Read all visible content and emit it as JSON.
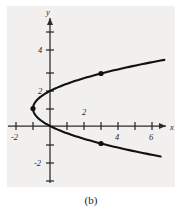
{
  "figure": {
    "caption": "(b)",
    "background_color": "#f1f0ee",
    "curve_color": "#111111",
    "axis_color": "#2b2b2b"
  },
  "axes": {
    "x_axis_name": "x",
    "y_axis_name": "y",
    "x_tick_labels": [
      "-2",
      "2",
      "4",
      "6"
    ],
    "y_tick_labels": [
      "4",
      "2",
      "-2"
    ],
    "x_ticks_all": [
      -2,
      -1,
      1,
      2,
      3,
      4,
      5,
      6,
      7
    ],
    "y_ticks_all": [
      5,
      4,
      3,
      2,
      1,
      -1,
      -2,
      -3
    ],
    "xlim": [
      -2.9,
      7.6
    ],
    "ylim": [
      -3.6,
      5.4
    ],
    "unit_px_x": 17,
    "unit_px_y": 17.5
  },
  "chart_data": {
    "type": "line",
    "title": "",
    "subtitle": "",
    "xlabel": "x",
    "ylabel": "y",
    "xlim": [
      -2.9,
      7.6
    ],
    "ylim": [
      -3.6,
      5.4
    ],
    "grid": false,
    "legend": "none",
    "equation": "x = (y - 1)^2 - 1",
    "orientation": "rightward-opening parabola",
    "vertex": [
      -1,
      1
    ],
    "series": [
      {
        "name": "parabola",
        "x": [
          -1.0,
          -0.96,
          -0.84,
          -0.64,
          -0.36,
          0.0,
          0.44,
          0.96,
          1.56,
          2.24,
          3.0,
          3.84,
          4.76,
          5.76,
          6.6
        ],
        "y": [
          1.0,
          1.2,
          1.4,
          1.6,
          1.8,
          2.0,
          2.2,
          2.4,
          2.6,
          2.8,
          3.0,
          3.2,
          3.4,
          3.6,
          3.76
        ]
      },
      {
        "name": "parabola-lower",
        "x": [
          -1.0,
          -0.96,
          -0.84,
          -0.64,
          -0.36,
          0.0,
          0.44,
          0.96,
          1.56,
          2.24,
          3.0,
          3.84,
          4.76,
          5.76,
          6.6
        ],
        "y": [
          1.0,
          0.8,
          0.6,
          0.4,
          0.2,
          0.0,
          -0.2,
          -0.4,
          -0.6,
          -0.8,
          -1.0,
          -1.2,
          -1.4,
          -1.6,
          -1.76
        ]
      }
    ],
    "points": [
      {
        "label": "vertex",
        "x": -1,
        "y": 1
      },
      {
        "label": "upper-point",
        "x": 3,
        "y": 3
      },
      {
        "label": "lower-point",
        "x": 3,
        "y": -1
      }
    ],
    "annotations": [
      "(b)"
    ]
  }
}
